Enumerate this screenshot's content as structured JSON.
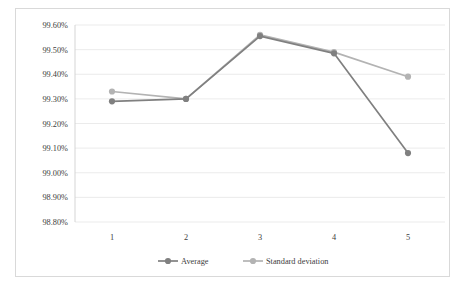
{
  "chart_data": {
    "type": "line",
    "title": "",
    "xlabel": "",
    "ylabel": "",
    "categories": [
      "1",
      "2",
      "3",
      "4",
      "5"
    ],
    "ylim": [
      98.8,
      99.6
    ],
    "ytick_labels": [
      "99.60%",
      "99.50%",
      "99.40%",
      "99.30%",
      "99.20%",
      "99.10%",
      "99.00%",
      "98.90%",
      "98.80%"
    ],
    "ytick_values": [
      99.6,
      99.5,
      99.4,
      99.3,
      99.2,
      99.1,
      99.0,
      98.9,
      98.8
    ],
    "y_unit": "%",
    "grid": true,
    "legend_position": "bottom",
    "series": [
      {
        "name": "Average",
        "color": "#808080",
        "values": [
          99.29,
          99.3,
          99.555,
          99.485,
          99.08
        ]
      },
      {
        "name": "Standard deviation",
        "color": "#b3b3b3",
        "values": [
          99.33,
          99.3,
          99.56,
          99.49,
          99.39
        ]
      }
    ]
  },
  "legend": {
    "items": [
      {
        "label": "Average"
      },
      {
        "label": "Standard deviation"
      }
    ]
  }
}
